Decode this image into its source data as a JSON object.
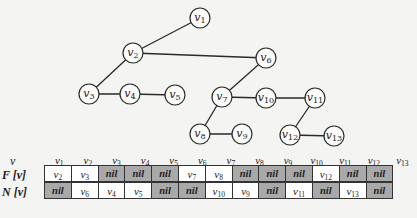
{
  "graph": {
    "nodes": [
      {
        "id": "v1",
        "label": "v",
        "sub": "1",
        "x": 200,
        "y": 18
      },
      {
        "id": "v2",
        "label": "v",
        "sub": "2",
        "x": 133,
        "y": 53
      },
      {
        "id": "v3",
        "label": "v",
        "sub": "3",
        "x": 89,
        "y": 94
      },
      {
        "id": "v4",
        "label": "v",
        "sub": "4",
        "x": 130,
        "y": 94
      },
      {
        "id": "v5",
        "label": "v",
        "sub": "5",
        "x": 175,
        "y": 95
      },
      {
        "id": "v6",
        "label": "v",
        "sub": "6",
        "x": 266,
        "y": 58
      },
      {
        "id": "v7",
        "label": "v",
        "sub": "7",
        "x": 222,
        "y": 97
      },
      {
        "id": "v10",
        "label": "v",
        "sub": "10",
        "x": 266,
        "y": 98
      },
      {
        "id": "v11",
        "label": "v",
        "sub": "11",
        "x": 315,
        "y": 98
      },
      {
        "id": "v8",
        "label": "v",
        "sub": "8",
        "x": 200,
        "y": 134
      },
      {
        "id": "v9",
        "label": "v",
        "sub": "9",
        "x": 242,
        "y": 134
      },
      {
        "id": "v12",
        "label": "v",
        "sub": "12",
        "x": 290,
        "y": 135
      },
      {
        "id": "v13",
        "label": "v",
        "sub": "13",
        "x": 334,
        "y": 136
      }
    ],
    "edges": [
      [
        "v1",
        "v2"
      ],
      [
        "v2",
        "v6"
      ],
      [
        "v2",
        "v3"
      ],
      [
        "v3",
        "v4"
      ],
      [
        "v4",
        "v5"
      ],
      [
        "v6",
        "v7"
      ],
      [
        "v7",
        "v10"
      ],
      [
        "v10",
        "v11"
      ],
      [
        "v7",
        "v8"
      ],
      [
        "v8",
        "v9"
      ],
      [
        "v11",
        "v12"
      ],
      [
        "v12",
        "v13"
      ]
    ]
  },
  "table": {
    "header_label": "v",
    "rows": [
      {
        "label": "F [v]",
        "values": [
          "v2",
          "v3",
          "nil",
          "nil",
          "nil",
          "v7",
          "v8",
          "nil",
          "nil",
          "nil",
          "v12",
          "nil",
          "nil"
        ]
      },
      {
        "label": "N [v]",
        "values": [
          "nil",
          "v6",
          "v4",
          "v5",
          "nil",
          "nil",
          "v10",
          "v9",
          "nil",
          "v11",
          "nil",
          "v13",
          "nil"
        ]
      }
    ],
    "columns": [
      "v1",
      "v2",
      "v3",
      "v4",
      "v5",
      "v6",
      "v7",
      "v8",
      "v9",
      "v10",
      "v11",
      "v12",
      "v13"
    ],
    "colors": {
      "nil_cell": "#a9a9a9",
      "value_cell": "#ffffff",
      "border": "#333333"
    }
  }
}
